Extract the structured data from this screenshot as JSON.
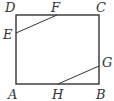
{
  "diagram": {
    "type": "geometry",
    "stroke_color": "#333333",
    "points": {
      "A": {
        "label": "A",
        "x": 16,
        "y": 84
      },
      "B": {
        "label": "B",
        "x": 99,
        "y": 84
      },
      "C": {
        "label": "C",
        "x": 99,
        "y": 15
      },
      "D": {
        "label": "D",
        "x": 16,
        "y": 15
      },
      "E": {
        "label": "E",
        "x": 16,
        "y": 33
      },
      "F": {
        "label": "F",
        "x": 57,
        "y": 15
      },
      "G": {
        "label": "G",
        "x": 99,
        "y": 66
      },
      "H": {
        "label": "H",
        "x": 58,
        "y": 84
      }
    },
    "segments": [
      [
        "A",
        "B"
      ],
      [
        "B",
        "C"
      ],
      [
        "C",
        "D"
      ],
      [
        "D",
        "A"
      ],
      [
        "E",
        "F"
      ],
      [
        "H",
        "G"
      ]
    ]
  }
}
